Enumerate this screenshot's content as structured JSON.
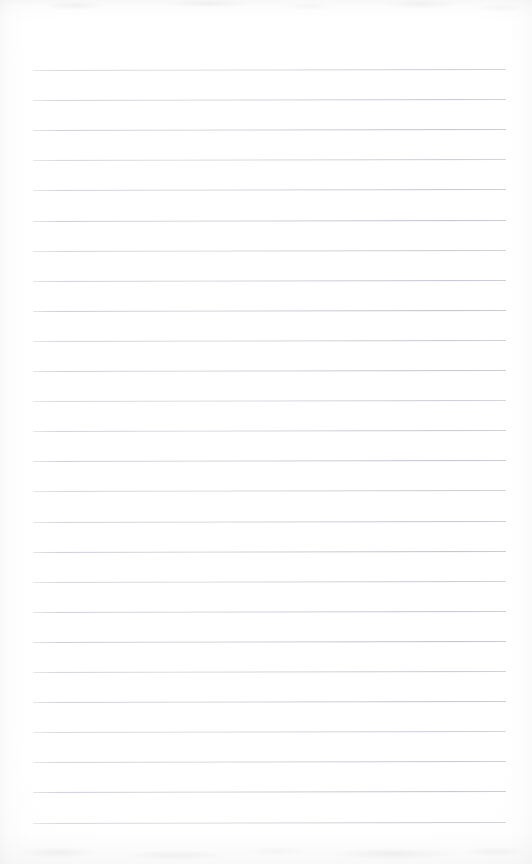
{
  "document": {
    "kind": "scanned-lined-notebook-page",
    "title": "",
    "body_text": "",
    "is_blank": true,
    "page_width": 532,
    "page_height": 864,
    "paper_color": "#fefefe",
    "rule_color": "#c6cad2",
    "rule_count": 26,
    "rule_left_x": 33,
    "rule_right_x": 506,
    "rule_first_y": 70,
    "rule_spacing": 30.1,
    "rule_tilt_deg": -0.11,
    "margins": {
      "top": 70,
      "bottom": 42,
      "left": 33,
      "right": 26
    }
  }
}
